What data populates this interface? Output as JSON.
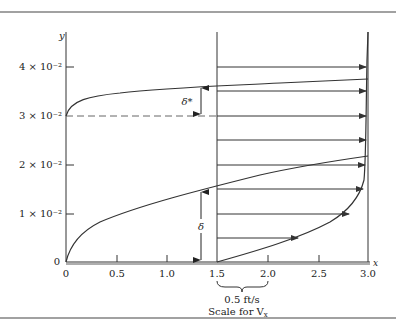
{
  "figure": {
    "y_axis_label": "y",
    "x_axis_label": "x",
    "y_ticks": [
      {
        "label": "0",
        "y": 262
      },
      {
        "label": "1 × 10⁻²",
        "y": 214
      },
      {
        "label": "2 × 10⁻²",
        "y": 165
      },
      {
        "label": "3 × 10⁻²",
        "y": 116
      },
      {
        "label": "4 × 10⁻²",
        "y": 67
      }
    ],
    "x_ticks": [
      {
        "label": "0",
        "x": 66
      },
      {
        "label": "0.5",
        "x": 117
      },
      {
        "label": "1.0",
        "x": 167
      },
      {
        "label": "1.5",
        "x": 217
      },
      {
        "label": "2.0",
        "x": 268
      },
      {
        "label": "2.5",
        "x": 319
      },
      {
        "label": "3.0",
        "x": 368
      }
    ],
    "delta_star_label": "δ*",
    "delta_label": "δ",
    "scale_value": "0.5 ft/s",
    "scale_caption": "Scale for V",
    "scale_caption_sub": "x",
    "colors": {
      "line": "#333333",
      "text": "#222222",
      "dash": "#666666"
    }
  }
}
